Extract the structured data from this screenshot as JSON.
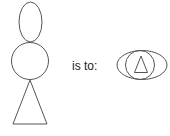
{
  "diagram": {
    "type": "analogy",
    "relation_text": "is to:",
    "stroke_color": "#555555",
    "left_figure": {
      "description": "stacked figure: ellipse on top of circle on top of triangle",
      "parts": [
        "ellipse",
        "circle",
        "triangle"
      ]
    },
    "right_figure": {
      "description": "ellipse containing circle containing triangle",
      "parts": [
        "ellipse",
        "circle",
        "triangle"
      ]
    }
  }
}
